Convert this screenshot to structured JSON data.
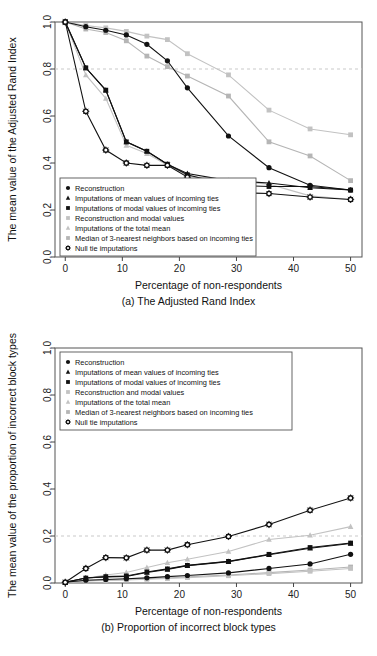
{
  "figure": {
    "background": "#ffffff",
    "panels": [
      "a",
      "b"
    ]
  },
  "common": {
    "xlabel": "Percentage of non-respondents",
    "x_ticks": [
      0,
      10,
      20,
      30,
      40,
      50
    ],
    "xlim": [
      -1.8,
      52
    ],
    "legend_entries": [
      {
        "label": "Reconstruction",
        "marker": "circle",
        "color": "#111111"
      },
      {
        "label": "Imputations of mean values of incoming ties",
        "marker": "triangle",
        "color": "#111111"
      },
      {
        "label": "Imputations of modal values of incoming ties",
        "marker": "square",
        "color": "#111111"
      },
      {
        "label": "Reconstruction and modal values",
        "marker": "square",
        "color": "#c2c2c2"
      },
      {
        "label": "Imputations of the total mean",
        "marker": "triangle",
        "color": "#c2c2c2"
      },
      {
        "label": "Median of 3-nearest neighbors based on incoming ties",
        "marker": "square",
        "color": "#b5b5b5"
      },
      {
        "label": "Null tie imputations",
        "marker": "star-circle",
        "color": "#111111"
      }
    ]
  },
  "chart_data": [
    {
      "id": "a",
      "type": "line",
      "title": "",
      "caption": "(a) The Adjusted Rand Index",
      "xlabel": "Percentage of non-respondents",
      "ylabel": "The mean value of the Adjusted Rand Index",
      "xlim": [
        -1.8,
        52
      ],
      "ylim": [
        0.0,
        1.0
      ],
      "x_ticks": [
        0,
        10,
        20,
        30,
        40,
        50
      ],
      "y_ticks": [
        0.0,
        0.2,
        0.4,
        0.6,
        0.8,
        1.0
      ],
      "grid": false,
      "reference_line_y": 0.8,
      "legend_position": "bottom-left",
      "x": [
        0,
        3.6,
        7.1,
        10.7,
        14.3,
        17.9,
        21.4,
        28.6,
        35.7,
        42.9,
        50
      ],
      "series": [
        {
          "name": "Reconstruction",
          "marker": "circle",
          "color": "#111111",
          "values": [
            1.0,
            0.98,
            0.965,
            0.945,
            0.905,
            0.835,
            0.72,
            0.515,
            0.38,
            0.305,
            0.285
          ]
        },
        {
          "name": "Imputations of mean values of incoming ties",
          "marker": "triangle",
          "color": "#111111",
          "values": [
            1.0,
            0.805,
            0.71,
            0.49,
            0.45,
            0.395,
            0.355,
            0.325,
            0.315,
            0.295,
            0.285
          ]
        },
        {
          "name": "Imputations of modal values of incoming ties",
          "marker": "square",
          "color": "#111111",
          "values": [
            1.0,
            0.805,
            0.71,
            0.49,
            0.45,
            0.395,
            0.35,
            0.305,
            0.3,
            0.3,
            0.285
          ]
        },
        {
          "name": "Reconstruction and modal values",
          "marker": "square",
          "color": "#c2c2c2",
          "values": [
            1.0,
            0.985,
            0.975,
            0.96,
            0.94,
            0.925,
            0.865,
            0.775,
            0.625,
            0.545,
            0.52
          ]
        },
        {
          "name": "Imputations of the total mean",
          "marker": "triangle",
          "color": "#c2c2c2",
          "values": [
            1.0,
            0.775,
            0.675,
            0.475,
            0.44,
            0.39,
            0.345,
            0.325,
            0.31,
            0.26,
            0.245
          ]
        },
        {
          "name": "Median of 3-nearest neighbors based on incoming ties",
          "marker": "square",
          "color": "#b5b5b5",
          "values": [
            1.0,
            0.97,
            0.955,
            0.92,
            0.855,
            0.81,
            0.77,
            0.685,
            0.49,
            0.43,
            0.325
          ]
        },
        {
          "name": "Null tie imputations",
          "marker": "star-circle",
          "color": "#111111",
          "values": [
            1.0,
            0.62,
            0.455,
            0.4,
            0.39,
            0.39,
            0.34,
            0.275,
            0.27,
            0.255,
            0.245
          ]
        }
      ]
    },
    {
      "id": "b",
      "type": "line",
      "title": "",
      "caption": "(b) Proportion of incorrect block types",
      "xlabel": "Percentage of non-respondents",
      "ylabel": "The mean value of the proportion of incorrect block types",
      "xlim": [
        -1.8,
        52
      ],
      "ylim": [
        0.0,
        1.0
      ],
      "x_ticks": [
        0,
        10,
        20,
        30,
        40,
        50
      ],
      "y_ticks": [
        0.0,
        0.2,
        0.4,
        0.6,
        0.8,
        1.0
      ],
      "grid": false,
      "reference_line_y": 0.2,
      "legend_position": "top-left",
      "x": [
        0,
        3.6,
        7.1,
        10.7,
        14.3,
        17.9,
        21.4,
        28.6,
        35.7,
        42.9,
        50
      ],
      "series": [
        {
          "name": "Reconstruction",
          "marker": "circle",
          "color": "#111111",
          "values": [
            0.003,
            0.012,
            0.015,
            0.018,
            0.022,
            0.027,
            0.032,
            0.043,
            0.062,
            0.081,
            0.122
          ]
        },
        {
          "name": "Imputations of mean values of incoming ties",
          "marker": "triangle",
          "color": "#111111",
          "values": [
            0.003,
            0.021,
            0.026,
            0.028,
            0.045,
            0.058,
            0.074,
            0.091,
            0.12,
            0.148,
            0.168
          ]
        },
        {
          "name": "Imputations of modal values of incoming ties",
          "marker": "square",
          "color": "#111111",
          "values": [
            0.003,
            0.021,
            0.027,
            0.03,
            0.047,
            0.06,
            0.075,
            0.092,
            0.122,
            0.151,
            0.17
          ]
        },
        {
          "name": "Reconstruction and modal values",
          "marker": "square",
          "color": "#c2c2c2",
          "values": [
            0.003,
            0.009,
            0.011,
            0.013,
            0.016,
            0.019,
            0.023,
            0.031,
            0.04,
            0.05,
            0.062
          ]
        },
        {
          "name": "Imputations of the total mean",
          "marker": "triangle",
          "color": "#c2c2c2",
          "values": [
            0.003,
            0.02,
            0.034,
            0.045,
            0.066,
            0.086,
            0.101,
            0.134,
            0.185,
            0.203,
            0.24
          ]
        },
        {
          "name": "Median of 3-nearest neighbors based on incoming ties",
          "marker": "square",
          "color": "#b5b5b5",
          "values": [
            0.003,
            0.01,
            0.012,
            0.014,
            0.018,
            0.021,
            0.026,
            0.034,
            0.044,
            0.055,
            0.068
          ]
        },
        {
          "name": "Null tie imputations",
          "marker": "star-circle",
          "color": "#111111",
          "values": [
            0.003,
            0.062,
            0.108,
            0.107,
            0.14,
            0.14,
            0.163,
            0.198,
            0.249,
            0.31,
            0.362
          ]
        }
      ]
    }
  ]
}
